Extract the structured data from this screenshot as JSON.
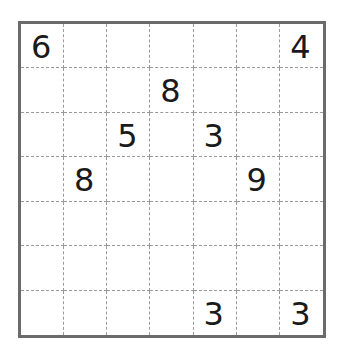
{
  "puzzle": {
    "rows": 7,
    "cols": 7,
    "grid": [
      [
        "6",
        "",
        "",
        "",
        "",
        "",
        "4"
      ],
      [
        "",
        "",
        "",
        "8",
        "",
        "",
        ""
      ],
      [
        "",
        "",
        "5",
        "",
        "3",
        "",
        ""
      ],
      [
        "",
        "8",
        "",
        "",
        "",
        "9",
        ""
      ],
      [
        "",
        "",
        "",
        "",
        "",
        "",
        ""
      ],
      [
        "",
        "",
        "",
        "",
        "",
        "",
        ""
      ],
      [
        "",
        "",
        "",
        "",
        "3",
        "",
        "3"
      ]
    ],
    "colors": {
      "border": "#6b6b6b",
      "gridline": "#9a9a9a",
      "digit": "#1a1a1a",
      "background": "#ffffff"
    }
  }
}
